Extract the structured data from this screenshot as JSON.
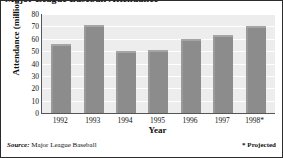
{
  "figure": {
    "title": "Major League Baseball Attendance",
    "source_label": "Source:",
    "source_text": " Major League Baseball",
    "projected_note": "* Projected"
  },
  "chart_data": {
    "type": "bar",
    "title": "Major League Baseball Attendance",
    "xlabel": "Year",
    "ylabel": "Attendance (millions)",
    "categories": [
      "1992",
      "1993",
      "1994",
      "1995",
      "1996",
      "1997",
      "1998*"
    ],
    "values": [
      56,
      71,
      50,
      51,
      60,
      63,
      70.5
    ],
    "ylim": [
      0,
      80
    ],
    "ytick_labels": [
      "80",
      "70",
      "60",
      "50",
      "40",
      "30",
      "20",
      "10",
      "0"
    ],
    "ytick_values": [
      80,
      70,
      60,
      50,
      40,
      30,
      20,
      10,
      0
    ],
    "grid": true,
    "legend": "none",
    "series_color": "#8c8c8c",
    "plot_background": "#ededed",
    "gridline_color": "#ffffff",
    "annotations": [
      "* Projected"
    ]
  }
}
